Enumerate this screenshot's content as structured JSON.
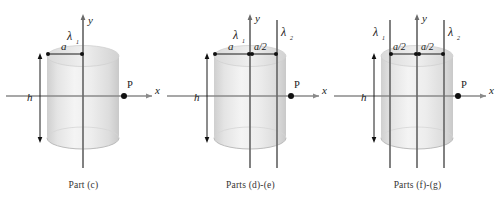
{
  "figure": {
    "background_color": "#ffffff",
    "axis_color": "#8a8a8a",
    "line_color": "#5a5a5a",
    "label_color": "#1a1a1a",
    "cylinder_fill_light": "#f2f2f2",
    "cylinder_fill_mid": "#dcdcdc",
    "cylinder_fill_edge": "#c8c8c8"
  },
  "panels": [
    {
      "id": "part-c",
      "caption": "Part (c)",
      "axis_y_label": "y",
      "axis_x_label": "x",
      "point_label": "P",
      "height_label": "h",
      "radius_label": "a",
      "charge_lines": [
        {
          "name": "lambda-1",
          "label": "λ",
          "subscript": "1",
          "position": "y-axis"
        }
      ],
      "dimensions": [
        {
          "name": "radius",
          "label": "a"
        },
        {
          "name": "height",
          "label": "h"
        }
      ]
    },
    {
      "id": "parts-d-e",
      "caption": "Parts (d)-(e)",
      "axis_y_label": "y",
      "axis_x_label": "x",
      "point_label": "P",
      "height_label": "h",
      "charge_lines": [
        {
          "name": "lambda-1",
          "label": "λ",
          "subscript": "1",
          "position": "y-axis"
        },
        {
          "name": "lambda-2",
          "label": "λ",
          "subscript": "2",
          "position": "offset-right"
        }
      ],
      "dimensions": [
        {
          "name": "radius",
          "label": "a"
        },
        {
          "name": "offset",
          "label": "a/2"
        },
        {
          "name": "height",
          "label": "h"
        }
      ]
    },
    {
      "id": "parts-f-g",
      "caption": "Parts (f)-(g)",
      "axis_y_label": "y",
      "axis_x_label": "x",
      "point_label": "P",
      "height_label": "h",
      "charge_lines": [
        {
          "name": "lambda-1",
          "label": "λ",
          "subscript": "1",
          "position": "offset-left"
        },
        {
          "name": "lambda-2",
          "label": "λ",
          "subscript": "2",
          "position": "offset-right"
        }
      ],
      "dimensions": [
        {
          "name": "offset-left",
          "label": "a/2"
        },
        {
          "name": "offset-right",
          "label": "a/2"
        },
        {
          "name": "height",
          "label": "h"
        }
      ]
    }
  ]
}
